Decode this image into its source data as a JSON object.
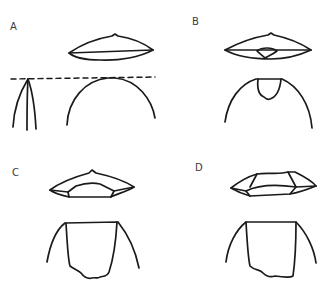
{
  "figure": {
    "panels": [
      {
        "id": "A",
        "label": "A",
        "description": "Lens-shaped section above; dashed tangent line across pointed arch (left) and rounded dome (right)"
      },
      {
        "id": "B",
        "label": "B",
        "description": "Lens with small central inner lens; dome with notch at apex"
      },
      {
        "id": "C",
        "label": "C",
        "description": "Faceted lens with trapezoidal inner face; flat-topped dome with wide rectangular cut"
      },
      {
        "id": "D",
        "label": "D",
        "description": "Faceted hexagonal lens; flat-topped dome with wide rectangular cut"
      }
    ],
    "colors": {
      "stroke": "#1a1a1a",
      "label": "#3a3a3a",
      "background": "#ffffff"
    }
  }
}
